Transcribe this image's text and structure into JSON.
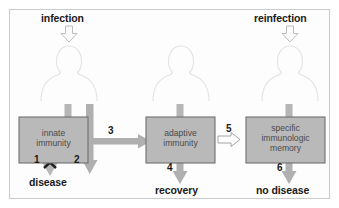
{
  "figure": {
    "background_color": "#ffffff",
    "panel_border_color": "#c9cacb",
    "box_fill_color": "#b9b9b9",
    "box_border_color": "#6e6e6e",
    "arrow_gray_color": "#b0b0b0",
    "arrow_outline_color": "#8a8a8a",
    "person_outline_color": "#e2e2e2",
    "text_color": "#1a1a1a",
    "box_text_color": "#4b4b4b"
  },
  "inputs": [
    {
      "id": "infection",
      "label": "infection",
      "icon": "down-arrow-outline-icon"
    },
    {
      "id": "reinfection",
      "label": "reinfection",
      "icon": "down-arrow-outline-icon"
    }
  ],
  "persons": [
    {
      "id": "person-left",
      "icon": "person-silhouette-icon"
    },
    {
      "id": "person-middle",
      "icon": "person-silhouette-icon"
    },
    {
      "id": "person-right",
      "icon": "person-silhouette-icon"
    }
  ],
  "boxes": [
    {
      "id": "innate-immunity",
      "label": "innate\nimmunity"
    },
    {
      "id": "adaptive-immunity",
      "label": "adaptive\nimmunity"
    },
    {
      "id": "immunologic-memory",
      "label": "specific\nimmunologic\nmemory"
    }
  ],
  "outcomes": [
    {
      "id": "disease",
      "label": "disease"
    },
    {
      "id": "recovery",
      "label": "recovery"
    },
    {
      "id": "no-disease",
      "label": "no disease"
    }
  ],
  "step_numbers": [
    {
      "id": "step-1",
      "label": "1",
      "blocked": true,
      "blocked_marker": "x-cross-icon"
    },
    {
      "id": "step-2",
      "label": "2",
      "blocked": false
    },
    {
      "id": "step-3",
      "label": "3",
      "blocked": false
    },
    {
      "id": "step-4",
      "label": "4",
      "blocked": false
    },
    {
      "id": "step-5",
      "label": "5",
      "blocked": false
    },
    {
      "id": "step-6",
      "label": "6",
      "blocked": false
    }
  ]
}
